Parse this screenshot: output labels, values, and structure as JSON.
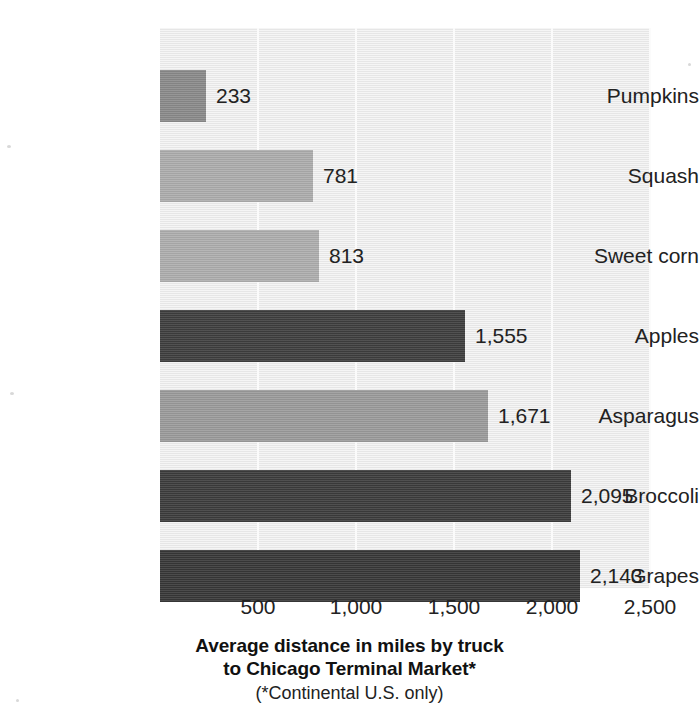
{
  "chart_data": {
    "type": "bar",
    "orientation": "horizontal",
    "title": "",
    "categories": [
      "Pumpkins",
      "Squash",
      "Sweet corn",
      "Apples",
      "Asparagus",
      "Broccoli",
      "Grapes"
    ],
    "values": [
      233,
      781,
      813,
      1555,
      1671,
      2095,
      2143
    ],
    "value_labels": [
      "233",
      "781",
      "813",
      "1,555",
      "1,671",
      "2,095",
      "2,143"
    ],
    "bar_colors": [
      "#8a8a8a",
      "#adadad",
      "#aeaeae",
      "#3e3e3e",
      "#9b9b9b",
      "#3c3c3c",
      "#383838"
    ],
    "xlabel": "Average distance in miles by truck to Chicago Terminal Market*",
    "ylabel": "",
    "xlim": [
      0,
      2500
    ],
    "xticks": [
      500,
      1000,
      1500,
      2000,
      2500
    ],
    "xtick_labels": [
      "500",
      "1,000",
      "1,500",
      "2,000",
      "2,500"
    ],
    "grid": "vertical",
    "legend": "none",
    "plot_background": "#e9e9e9",
    "figure_background": "#ffffff"
  },
  "caption": {
    "line1": "Average distance in miles by truck",
    "line2": "to Chicago Terminal Market*",
    "line3": "(*Continental U.S. only)"
  }
}
